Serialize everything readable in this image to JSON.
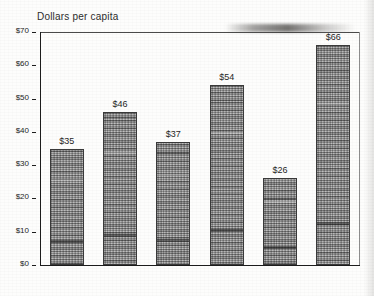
{
  "chart_data": {
    "type": "bar",
    "title": "Dollars per capita",
    "xlabel": "",
    "ylabel": "",
    "categories": [
      "Attala",
      "Coos",
      "Kossuth",
      "Latah",
      "Nicholas",
      "Yavapai"
    ],
    "values": [
      35,
      46,
      37,
      54,
      26,
      66
    ],
    "value_labels": [
      "$35",
      "$46",
      "$37",
      "$54",
      "$26",
      "$66"
    ],
    "ylim": [
      0,
      70
    ],
    "ytick_values": [
      0,
      10,
      20,
      30,
      40,
      50,
      60,
      70
    ],
    "ytick_labels": [
      "$0",
      "$10",
      "$20",
      "$30",
      "$40",
      "$50",
      "$60",
      "$70"
    ],
    "grid": false,
    "legend": false,
    "legend_position": "none",
    "bar_color": "#9a9a9a",
    "axis_color": "#1d1d1d",
    "text_color": "#242424"
  }
}
